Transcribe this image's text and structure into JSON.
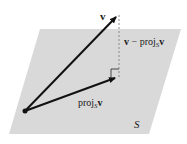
{
  "diagram": {
    "plane": {
      "label": "S",
      "fill": "#d9d9d9",
      "corners": [
        [
          40,
          29
        ],
        [
          181,
          29
        ],
        [
          149,
          134
        ],
        [
          9,
          134
        ]
      ]
    },
    "origin": {
      "x": 25,
      "y": 111,
      "color": "#111111"
    },
    "vectors": [
      {
        "name": "v",
        "label": "v",
        "from": [
          25,
          111
        ],
        "to": [
          118,
          15
        ],
        "style": "solid-arrow"
      },
      {
        "name": "proj",
        "label_main": "proj",
        "label_sub": "S",
        "label_tail": "v",
        "from": [
          25,
          111
        ],
        "to": [
          118,
          77
        ],
        "style": "solid-arrow"
      },
      {
        "name": "residual",
        "label_main": "v − proj",
        "label_sub": "S",
        "label_tail": "v",
        "from": [
          119,
          15
        ],
        "to": [
          119,
          77
        ],
        "style": "dashed"
      }
    ],
    "right_angle_marker": {
      "x": 111,
      "y": 69,
      "size": 8
    },
    "labels": {
      "v": "v",
      "residual_prefix": "v − proj",
      "residual_sub": "S",
      "residual_suffix": "v",
      "proj_prefix": "proj",
      "proj_sub": "S",
      "proj_suffix": "v",
      "plane": "S"
    },
    "colors": {
      "line": "#111111",
      "dash": "#8a8a8a",
      "plane": "#d9d9d9",
      "text": "#1a1a1a"
    }
  }
}
